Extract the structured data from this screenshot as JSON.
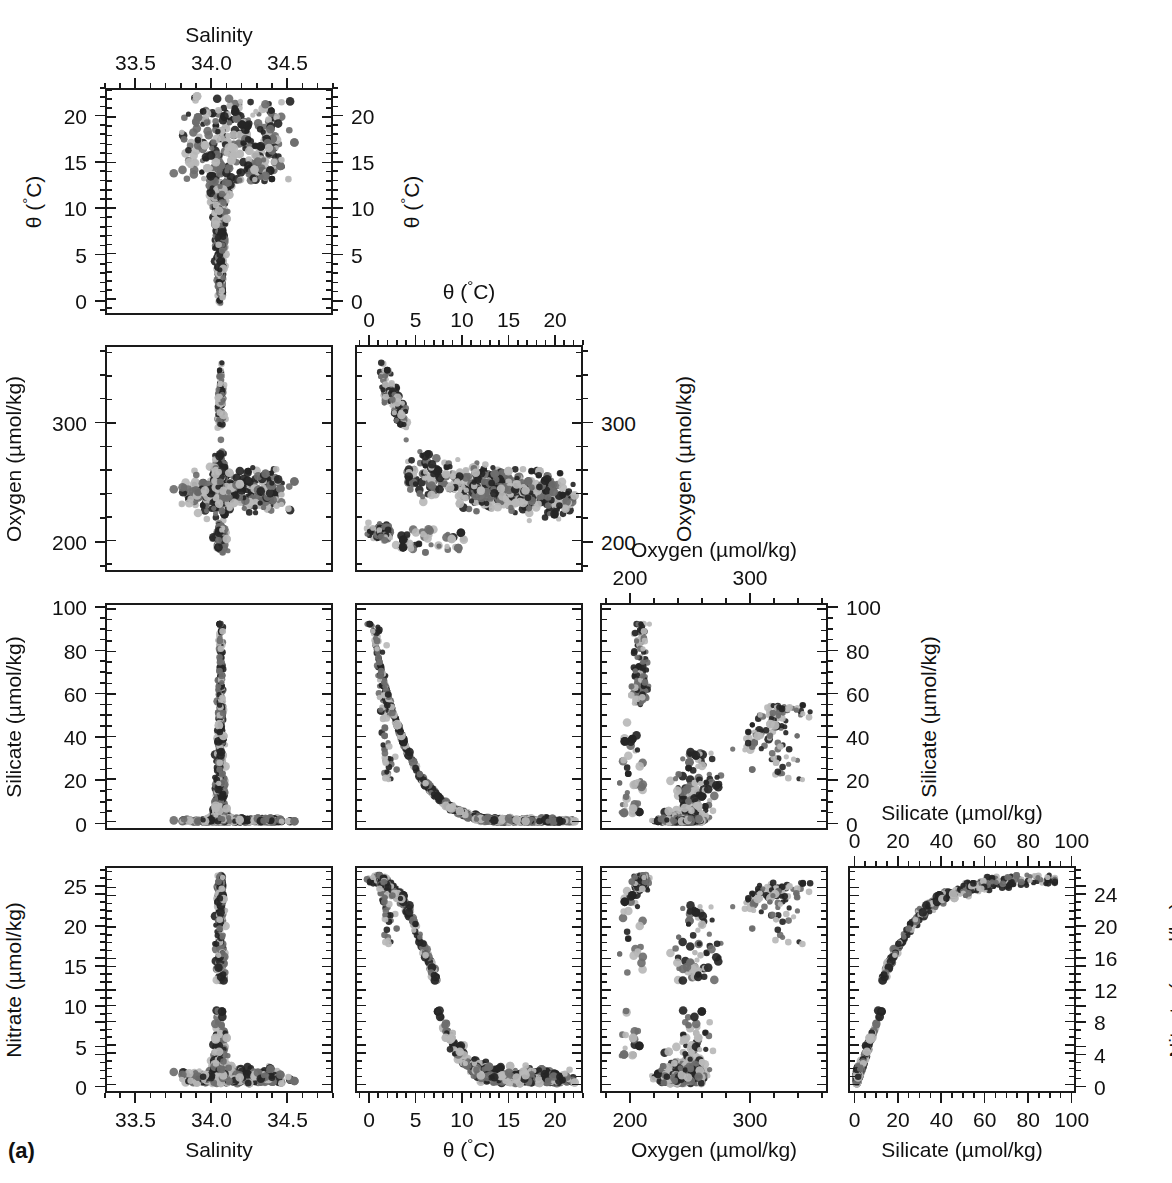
{
  "figure": {
    "panel_label": "(a)",
    "type": "scatter-plot-matrix",
    "n_rows": 4,
    "n_cols": 4,
    "series_colors": [
      "#252525",
      "#6e6e6e",
      "#b9b9b9"
    ]
  },
  "variables": [
    {
      "key": "salinity",
      "title": "Salinity",
      "min": 33.3,
      "max": 34.8,
      "ticks": [
        33.5,
        34.0,
        34.5
      ],
      "tick_labels": [
        "33.5",
        "34.0",
        "34.5"
      ],
      "minor_step": 0.1
    },
    {
      "key": "theta",
      "title": "θ (°C)",
      "title_html": "θ (<sup>°</sup>C)",
      "min": -1.5,
      "max": 23.0,
      "ticks": [
        0,
        5,
        10,
        15,
        20
      ],
      "tick_labels": [
        "0",
        "5",
        "10",
        "15",
        "20"
      ],
      "minor_step": 1
    },
    {
      "key": "oxygen",
      "title": "Oxygen (µmol/kg)",
      "min": 175,
      "max": 365,
      "ticks": [
        200,
        300
      ],
      "tick_labels": [
        "200",
        "300"
      ],
      "minor_step": 20
    },
    {
      "key": "silicate",
      "title": "Silicate (µmol/kg)",
      "min": -3,
      "max": 102,
      "ticks": [
        0,
        20,
        40,
        60,
        80,
        100
      ],
      "tick_labels": [
        "0",
        "20",
        "40",
        "60",
        "80",
        "100"
      ],
      "minor_step": 5
    },
    {
      "key": "nitrate",
      "title": "Nitrate (µmol/kg)",
      "min": -0.8,
      "max": 27.5,
      "ticks": [
        0,
        5,
        10,
        15,
        20,
        25
      ],
      "tick_labels": [
        "0",
        "5",
        "10",
        "15",
        "20",
        "25"
      ],
      "ticks_alt": [
        0,
        4,
        8,
        12,
        16,
        20,
        24
      ],
      "tick_labels_alt": [
        "0",
        "4",
        "8",
        "12",
        "16",
        "20",
        "24"
      ],
      "minor_step": 1
    }
  ],
  "panels": [
    {
      "row": 0,
      "col": 0,
      "x": "salinity",
      "y": "theta",
      "top_axis": {
        "var": "salinity",
        "title": "Salinity",
        "labels": [
          "33.5",
          "34.0",
          "34.5"
        ]
      },
      "left_axis": {
        "var": "theta",
        "title": "θ (°C)",
        "labels": [
          "0",
          "5",
          "10",
          "15",
          "20"
        ]
      },
      "right_axis": {
        "var": "theta",
        "title": "θ (°C)",
        "labels": [
          "0",
          "5",
          "10",
          "15",
          "20"
        ]
      }
    },
    {
      "row": 1,
      "col": 0,
      "x": "salinity",
      "y": "oxygen",
      "left_axis": {
        "var": "oxygen",
        "title": "Oxygen (µmol/kg)",
        "labels": [
          "200",
          "300"
        ]
      }
    },
    {
      "row": 1,
      "col": 1,
      "x": "theta",
      "y": "oxygen",
      "top_axis": {
        "var": "theta",
        "title": "θ (°C)",
        "labels": [
          "0",
          "5",
          "10",
          "15",
          "20"
        ]
      },
      "right_axis": {
        "var": "oxygen",
        "title": "Oxygen (µmol/kg)",
        "labels": [
          "200",
          "300"
        ]
      }
    },
    {
      "row": 2,
      "col": 0,
      "x": "salinity",
      "y": "silicate",
      "left_axis": {
        "var": "silicate",
        "title": "Silicate (µmol/kg)",
        "labels": [
          "0",
          "20",
          "40",
          "60",
          "80",
          "100"
        ]
      }
    },
    {
      "row": 2,
      "col": 1,
      "x": "theta",
      "y": "silicate"
    },
    {
      "row": 2,
      "col": 2,
      "x": "oxygen",
      "y": "silicate",
      "top_axis": {
        "var": "oxygen",
        "title": "Oxygen (µmol/kg)",
        "labels": [
          "200",
          "300"
        ]
      },
      "right_axis": {
        "var": "silicate",
        "title": "Silicate (µmol/kg)",
        "labels": [
          "0",
          "20",
          "40",
          "60",
          "80",
          "100"
        ]
      }
    },
    {
      "row": 3,
      "col": 0,
      "x": "salinity",
      "y": "nitrate",
      "left_axis": {
        "var": "nitrate",
        "title": "Nitrate (µmol/kg)",
        "labels": [
          "0",
          "5",
          "10",
          "15",
          "20",
          "25"
        ]
      },
      "bottom_axis": {
        "var": "salinity",
        "title": "Salinity",
        "labels": [
          "33.5",
          "34.0",
          "34.5"
        ]
      }
    },
    {
      "row": 3,
      "col": 1,
      "x": "theta",
      "y": "nitrate",
      "bottom_axis": {
        "var": "theta",
        "title": "θ (°C)",
        "labels": [
          "0",
          "5",
          "10",
          "15",
          "20"
        ]
      }
    },
    {
      "row": 3,
      "col": 2,
      "x": "oxygen",
      "y": "nitrate",
      "bottom_axis": {
        "var": "oxygen",
        "title": "Oxygen (µmol/kg)",
        "labels": [
          "200",
          "300"
        ]
      }
    },
    {
      "row": 3,
      "col": 3,
      "x": "silicate",
      "y": "nitrate",
      "top_axis": {
        "var": "silicate",
        "title": "Silicate (µmol/kg)",
        "labels": [
          "0",
          "20",
          "40",
          "60",
          "80",
          "100"
        ]
      },
      "right_axis": {
        "var": "nitrate",
        "title": "Nitrate (µmol/kg)",
        "labels": [
          "0",
          "4",
          "8",
          "12",
          "16",
          "20",
          "24"
        ]
      },
      "bottom_axis": {
        "var": "silicate",
        "title": "Silicate (µmol/kg)",
        "labels": [
          "0",
          "20",
          "40",
          "60",
          "80",
          "100"
        ]
      }
    }
  ],
  "chart_data": {
    "type": "scatter",
    "title": "",
    "axis_variables": [
      "Salinity",
      "θ (°C)",
      "Oxygen (µmol/kg)",
      "Silicate (µmol/kg)",
      "Nitrate (µmol/kg)"
    ],
    "axis_ranges": {
      "Salinity": [
        33.3,
        34.8
      ],
      "θ (°C)": [
        -1.5,
        23.0
      ],
      "Oxygen (µmol/kg)": [
        175,
        365
      ],
      "Silicate (µmol/kg)": [
        -3,
        102
      ],
      "Nitrate (µmol/kg)": [
        -0.8,
        27.5
      ]
    },
    "tick_labels": {
      "Salinity": [
        "33.5",
        "34.0",
        "34.5"
      ],
      "θ (°C)": [
        "0",
        "5",
        "10",
        "15",
        "20"
      ],
      "Oxygen (µmol/kg)": [
        "200",
        "300"
      ],
      "Silicate (µmol/kg)": [
        "0",
        "20",
        "40",
        "60",
        "80",
        "100"
      ],
      "Nitrate (µmol/kg)": [
        "0",
        "5",
        "10",
        "15",
        "20",
        "25"
      ],
      "Nitrate_right (µmol/kg)": [
        "0",
        "4",
        "8",
        "12",
        "16",
        "20",
        "24"
      ]
    },
    "grid": false,
    "legend": "none",
    "series": [
      {
        "name": "group-dark",
        "color": "#252525"
      },
      {
        "name": "group-mid",
        "color": "#6e6e6e"
      },
      {
        "name": "group-light",
        "color": "#b9b9b9"
      }
    ],
    "relationships": [
      {
        "pair": [
          "Salinity",
          "θ (°C)"
        ],
        "shape": "inverted-L / hook: warm 15-21°C spread over 33.8-34.6 salinity, cold branch narrowing to ~34.05 at 0°C"
      },
      {
        "pair": [
          "Salinity",
          "Oxygen (µmol/kg)"
        ],
        "shape": "peak near 34.05 salinity reaching 350 µmol/kg, fan spreading down to 190"
      },
      {
        "pair": [
          "θ (°C)",
          "Oxygen (µmol/kg)"
        ],
        "shape": "high oxygen (300-355) at low θ, declining scatter toward 20°C / 230"
      },
      {
        "pair": [
          "Salinity",
          "Silicate (µmol/kg)"
        ],
        "shape": "narrow vertical spike at salinity 34.05 from 0 to 92, low values elsewhere"
      },
      {
        "pair": [
          "θ (°C)",
          "Silicate (µmol/kg)"
        ],
        "shape": "steep hyperbolic decay from 92 at 0°C to near 0 above 10°C"
      },
      {
        "pair": [
          "Oxygen (µmol/kg)",
          "Silicate (µmol/kg)"
        ],
        "shape": "narrow column near 205-215 oxygen rising to 92, broad low-silicate tail to 355 oxygen"
      },
      {
        "pair": [
          "Salinity",
          "Nitrate (µmol/kg)"
        ],
        "shape": "vertical spike at 34.05 up to 26, scattered low values 0-7"
      },
      {
        "pair": [
          "θ (°C)",
          "Nitrate (µmol/kg)"
        ],
        "shape": "near-linear decline from 26 at 0°C to ~0 at 20°C"
      },
      {
        "pair": [
          "Oxygen (µmol/kg)",
          "Nitrate (µmol/kg)"
        ],
        "shape": "high nitrate at low oxygen, broad negative relation to 355 oxygen"
      },
      {
        "pair": [
          "Silicate (µmol/kg)",
          "Nitrate (µmol/kg)"
        ],
        "shape": "tight saturating curve: steep rise 0-30 silicate then plateau ~25-26 nitrate at 90 silicate"
      }
    ]
  }
}
